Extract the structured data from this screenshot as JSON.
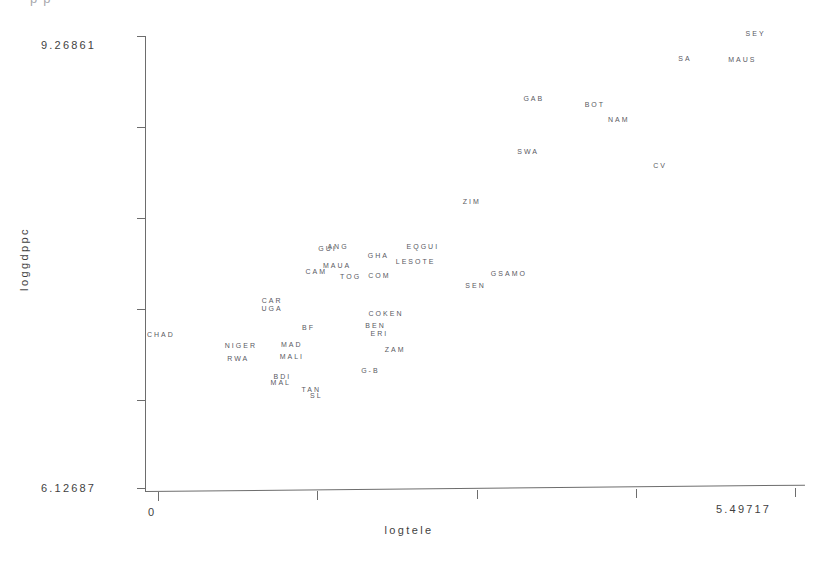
{
  "top_banner": "p    p",
  "axes": {
    "y_title": "loggdppc",
    "x_title": "logtele",
    "y_top_tick_label": "9.26861",
    "y_bottom_tick_label": "6.12687",
    "x_left_tick_label": "0",
    "x_right_tick_label": "5.49717"
  },
  "chart_data": {
    "type": "scatter",
    "title": "",
    "xlabel": "logtele",
    "ylabel": "loggdppc",
    "xlim": [
      0,
      5.49717
    ],
    "ylim": [
      6.12687,
      9.26861
    ],
    "grid": false,
    "legend": false,
    "point_marker": "text-label",
    "note": "Each observation is rendered as its country abbreviation text rather than a marker glyph.",
    "x_ticks": [
      0,
      1.374,
      2.749,
      4.123,
      5.49717
    ],
    "y_ticks": [
      6.12687,
      6.75522,
      7.38357,
      8.01191,
      8.64026,
      9.26861
    ],
    "points": [
      {
        "label": "SEY",
        "x": 5.157,
        "y": 9.281
      },
      {
        "label": "SA",
        "x": 4.547,
        "y": 9.113
      },
      {
        "label": "MAUS",
        "x": 5.043,
        "y": 9.104
      },
      {
        "label": "GAB",
        "x": 3.243,
        "y": 8.833
      },
      {
        "label": "BOT",
        "x": 3.77,
        "y": 8.791
      },
      {
        "label": "NAM",
        "x": 3.977,
        "y": 8.69
      },
      {
        "label": "SWA",
        "x": 3.195,
        "y": 8.467
      },
      {
        "label": "CV",
        "x": 4.333,
        "y": 8.372
      },
      {
        "label": "ZIM",
        "x": 2.707,
        "y": 8.124
      },
      {
        "label": "EQGUI",
        "x": 2.285,
        "y": 7.815
      },
      {
        "label": "GUI",
        "x": 1.464,
        "y": 7.797
      },
      {
        "label": "ANG",
        "x": 1.553,
        "y": 7.81
      },
      {
        "label": "GHA",
        "x": 1.902,
        "y": 7.749
      },
      {
        "label": "LESOTE",
        "x": 2.223,
        "y": 7.705
      },
      {
        "label": "MAUA",
        "x": 1.545,
        "y": 7.684
      },
      {
        "label": "CAM",
        "x": 1.366,
        "y": 7.639
      },
      {
        "label": "TOG",
        "x": 1.662,
        "y": 7.607
      },
      {
        "label": "COM",
        "x": 1.91,
        "y": 7.613
      },
      {
        "label": "GSAMO",
        "x": 3.028,
        "y": 7.625
      },
      {
        "label": "SEN",
        "x": 2.74,
        "y": 7.546
      },
      {
        "label": "CAR",
        "x": 0.985,
        "y": 7.438
      },
      {
        "label": "UGA",
        "x": 0.985,
        "y": 7.385
      },
      {
        "label": "COKEN",
        "x": 1.968,
        "y": 7.348
      },
      {
        "label": "BF",
        "x": 1.3,
        "y": 7.251
      },
      {
        "label": "BEN",
        "x": 1.877,
        "y": 7.268
      },
      {
        "label": "ERI",
        "x": 1.91,
        "y": 7.212
      },
      {
        "label": "CHAD",
        "x": 0.025,
        "y": 7.206
      },
      {
        "label": "NIGER",
        "x": 0.715,
        "y": 7.128
      },
      {
        "label": "MAD",
        "x": 1.155,
        "y": 7.134
      },
      {
        "label": "ZAM",
        "x": 2.046,
        "y": 7.1
      },
      {
        "label": "MALI",
        "x": 1.155,
        "y": 7.055
      },
      {
        "label": "RWA",
        "x": 0.692,
        "y": 7.036
      },
      {
        "label": "G-B",
        "x": 1.833,
        "y": 6.957
      },
      {
        "label": "BDI",
        "x": 1.073,
        "y": 6.917
      },
      {
        "label": "MAL",
        "x": 1.06,
        "y": 6.873
      },
      {
        "label": "TAN",
        "x": 1.323,
        "y": 6.822
      },
      {
        "label": "SL",
        "x": 1.366,
        "y": 6.781
      }
    ]
  }
}
